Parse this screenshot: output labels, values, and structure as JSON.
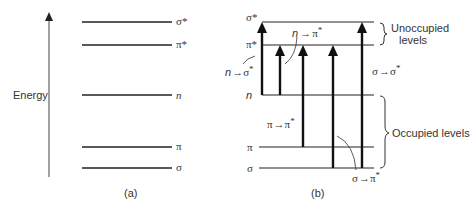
{
  "panel_a": {
    "axis_label": "Energy",
    "caption": "(a)",
    "levels": [
      {
        "id": "sigma_star",
        "label": "σ*",
        "y": 22
      },
      {
        "id": "pi_star",
        "label": "π*",
        "y": 45
      },
      {
        "id": "n",
        "label": "n",
        "y": 95
      },
      {
        "id": "pi",
        "label": "π",
        "y": 147
      },
      {
        "id": "sigma",
        "label": "σ",
        "y": 168
      }
    ]
  },
  "panel_b": {
    "caption": "(b)",
    "levels": [
      {
        "id": "sigma_star",
        "label": "σ*",
        "y": 22
      },
      {
        "id": "pi_star",
        "label": "π*",
        "y": 45
      },
      {
        "id": "n",
        "label": "n",
        "y": 95
      },
      {
        "id": "pi",
        "label": "π",
        "y": 147
      },
      {
        "id": "sigma",
        "label": "σ",
        "y": 168
      }
    ],
    "transitions": [
      {
        "label": "n → σ*",
        "from": "n",
        "to": "σ*"
      },
      {
        "label": "n → π*",
        "from": "n",
        "to": "π*"
      },
      {
        "label": "π → π*",
        "from": "π",
        "to": "π*"
      },
      {
        "label": "σ → π*",
        "from": "σ",
        "to": "π*"
      },
      {
        "label": "σ → σ*",
        "from": "σ",
        "to": "σ*"
      }
    ],
    "groups": {
      "unoccupied": "Unoccupied levels",
      "unoccupied_line1": "Unoccupied",
      "unoccupied_line2": "levels",
      "occupied": "Occupied levels"
    },
    "labels": {
      "n_sigma_star": {
        "from": "n",
        "to": "σ",
        "sup": "*"
      },
      "n_pi_star": {
        "from": "n",
        "to": "π",
        "sup": "*"
      },
      "pi_pi_star": {
        "from": "π",
        "to": "π",
        "sup": "*"
      },
      "sigma_pi_star": {
        "from": "σ",
        "to": "π",
        "sup": "*"
      },
      "sigma_sigma_star": {
        "from": "σ",
        "to": "σ",
        "sup": "*"
      }
    }
  },
  "colors": {
    "line": "#222222",
    "text": "#333333"
  }
}
